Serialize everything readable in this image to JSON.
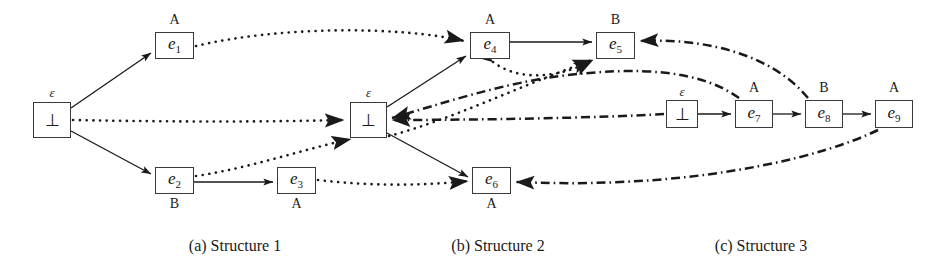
{
  "figure": {
    "background_color": "#ffffff",
    "line_color": "#1a1a1a"
  },
  "captions": [
    {
      "id": "cap-a",
      "text": "(a) Structure 1",
      "x": 150,
      "y": 240,
      "width": 170
    },
    {
      "id": "cap-b",
      "text": "(b) Structure 2",
      "x": 413,
      "y": 240,
      "width": 170
    },
    {
      "id": "cap-c",
      "text": "(c) Structure 3",
      "x": 676,
      "y": 240,
      "width": 170
    }
  ],
  "structures": [
    {
      "id": "structure-1",
      "caption": "(a) Structure 1",
      "nodes": [
        {
          "id": "s1-bot",
          "label": "⊥",
          "kind": "bottom",
          "tag": "ε",
          "tag_pos": "top",
          "x": 33,
          "y": 102,
          "w": 38,
          "h": 36
        },
        {
          "id": "s1-e1",
          "label": "e",
          "sub": "1",
          "kind": "event",
          "tag": "A",
          "tag_pos": "top",
          "x": 155,
          "y": 32,
          "w": 39,
          "h": 27
        },
        {
          "id": "s1-e2",
          "label": "e",
          "sub": "2",
          "kind": "event",
          "tag": "B",
          "tag_pos": "bottom",
          "x": 155,
          "y": 167,
          "w": 39,
          "h": 27
        },
        {
          "id": "s1-e3",
          "label": "e",
          "sub": "3",
          "kind": "event",
          "tag": "A",
          "tag_pos": "bottom",
          "x": 277,
          "y": 167,
          "w": 39,
          "h": 27
        }
      ],
      "edges": [
        {
          "id": "s1-bot-to-e1",
          "from": "s1-bot",
          "to": "s1-e1",
          "style": "solid"
        },
        {
          "id": "s1-bot-to-e2",
          "from": "s1-bot",
          "to": "s1-e2",
          "style": "solid"
        },
        {
          "id": "s1-e2-to-e3",
          "from": "s1-e2",
          "to": "s1-e3",
          "style": "solid"
        }
      ]
    },
    {
      "id": "structure-2",
      "caption": "(b) Structure 2",
      "nodes": [
        {
          "id": "s2-bot",
          "label": "⊥",
          "kind": "bottom",
          "tag": "ε",
          "tag_pos": "top",
          "x": 350,
          "y": 102,
          "w": 37,
          "h": 36
        },
        {
          "id": "s2-e4",
          "label": "e",
          "sub": "4",
          "kind": "event",
          "tag": "A",
          "tag_pos": "top",
          "x": 470,
          "y": 32,
          "w": 40,
          "h": 27
        },
        {
          "id": "s2-e5",
          "label": "e",
          "sub": "5",
          "kind": "event",
          "tag": "B",
          "tag_pos": "top",
          "x": 596,
          "y": 32,
          "w": 39,
          "h": 27
        },
        {
          "id": "s2-e6",
          "label": "e",
          "sub": "6",
          "kind": "event",
          "tag": "A",
          "tag_pos": "bottom",
          "x": 472,
          "y": 167,
          "w": 39,
          "h": 27
        }
      ],
      "edges": [
        {
          "id": "s2-bot-to-e4",
          "from": "s2-bot",
          "to": "s2-e4",
          "style": "solid"
        },
        {
          "id": "s2-e4-to-e5",
          "from": "s2-e4",
          "to": "s2-e5",
          "style": "solid"
        },
        {
          "id": "s2-bot-to-e6",
          "from": "s2-bot",
          "to": "s2-e6",
          "style": "solid"
        }
      ]
    },
    {
      "id": "structure-3",
      "caption": "(c) Structure 3",
      "nodes": [
        {
          "id": "s3-bot",
          "label": "⊥",
          "kind": "bottom",
          "tag": "ε",
          "tag_pos": "top",
          "x": 666,
          "y": 100,
          "w": 32,
          "h": 28
        },
        {
          "id": "s3-e7",
          "label": "e",
          "sub": "7",
          "kind": "event",
          "tag": "A",
          "tag_pos": "top",
          "x": 735,
          "y": 100,
          "w": 38,
          "h": 28
        },
        {
          "id": "s3-e8",
          "label": "e",
          "sub": "8",
          "kind": "event",
          "tag": "B",
          "tag_pos": "top",
          "x": 805,
          "y": 100,
          "w": 38,
          "h": 28
        },
        {
          "id": "s3-e9",
          "label": "e",
          "sub": "9",
          "kind": "event",
          "tag": "A",
          "tag_pos": "top",
          "x": 875,
          "y": 100,
          "w": 38,
          "h": 28
        }
      ],
      "edges": [
        {
          "id": "s3-bot-to-e7",
          "from": "s3-bot",
          "to": "s3-e7",
          "style": "solid"
        },
        {
          "id": "s3-e7-to-e8",
          "from": "s3-e7",
          "to": "s3-e8",
          "style": "solid"
        },
        {
          "id": "s3-e8-to-e9",
          "from": "s3-e8",
          "to": "s3-e9",
          "style": "solid"
        }
      ]
    }
  ],
  "morphism_edges": [
    {
      "id": "m-e1-e4",
      "from": "s1-e1",
      "to": "s2-e4",
      "style": "dotted",
      "direction": "right"
    },
    {
      "id": "m-bot1-bot2",
      "from": "s1-bot",
      "to": "s2-bot",
      "style": "dotted",
      "direction": "right"
    },
    {
      "id": "m-e2-bot2",
      "from": "s1-e2",
      "to": "s2-bot",
      "style": "dotted",
      "direction": "right"
    },
    {
      "id": "m-e3-e6",
      "from": "s1-e3",
      "to": "s2-e6",
      "style": "dotted",
      "direction": "right"
    },
    {
      "id": "m-e4-e5-lower",
      "from": "s2-e4",
      "to": "s2-e5",
      "style": "dotted",
      "direction": "right"
    },
    {
      "id": "m-bot2-e5",
      "from": "s2-bot",
      "to": "s2-e5",
      "style": "dotted",
      "direction": "right"
    },
    {
      "id": "m-e8-e5",
      "from": "s3-e8",
      "to": "s2-e5",
      "style": "dashdot",
      "direction": "left"
    },
    {
      "id": "m-e7-bot2",
      "from": "s3-e7",
      "to": "s2-bot",
      "style": "dashdot",
      "direction": "left"
    },
    {
      "id": "m-bot3-bot2",
      "from": "s3-bot",
      "to": "s2-bot",
      "style": "dashdot",
      "direction": "left"
    },
    {
      "id": "m-e9-e6",
      "from": "s3-e9",
      "to": "s2-e6",
      "style": "dashdot",
      "direction": "left"
    }
  ],
  "legend": {
    "solid_meaning": "causality / enabling",
    "dotted_meaning": "morphism from Structure 1 to Structure 2",
    "dashdot_meaning": "morphism from Structure 3 to Structure 2"
  }
}
